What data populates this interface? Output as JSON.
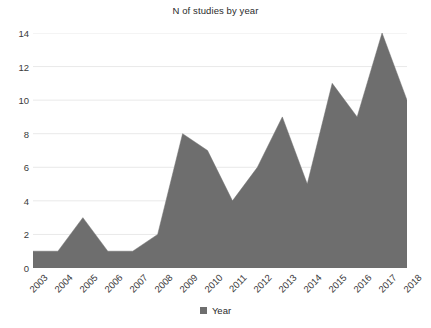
{
  "chart_data": {
    "type": "area",
    "title": "N of studies by year",
    "xlabel": "",
    "ylabel": "",
    "categories": [
      "2003",
      "2004",
      "2005",
      "2006",
      "2007",
      "2008",
      "2009",
      "2010",
      "2011",
      "2012",
      "2013",
      "2014",
      "2015",
      "2016",
      "2017",
      "2018"
    ],
    "values": [
      1,
      1,
      3,
      1,
      1,
      2,
      8,
      7,
      4,
      6,
      9,
      5,
      11,
      9,
      14,
      10
    ],
    "series": [
      {
        "name": "Year",
        "values": [
          1,
          1,
          3,
          1,
          1,
          2,
          8,
          7,
          4,
          6,
          9,
          5,
          11,
          9,
          14,
          10
        ],
        "color": "#6e6e6e"
      }
    ],
    "ylim": [
      0,
      14
    ],
    "y_ticks": [
      0,
      2,
      4,
      6,
      8,
      10,
      12,
      14
    ],
    "y_tick_labels": [
      "0",
      "2",
      "4",
      "6",
      "8",
      "10",
      "12",
      "14"
    ],
    "grid": true,
    "grid_color": "#e9e9e9",
    "legend": {
      "position": "bottom",
      "entries": [
        {
          "label": "Year",
          "color": "#6e6e6e",
          "marker": "square"
        }
      ]
    },
    "x_tick_rotation": -45,
    "background_color": "#ffffff",
    "title_color": "#2b2b2b",
    "axis_label_color": "#3a3a3a"
  }
}
